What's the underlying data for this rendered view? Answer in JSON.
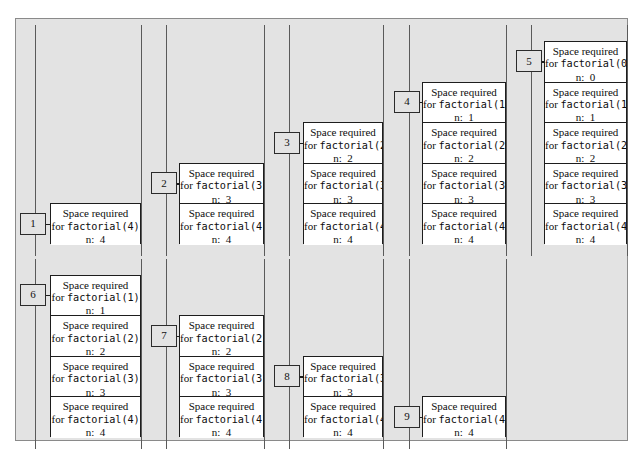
{
  "figure": {
    "background_color": "#e3e3e3",
    "frame_border_color": "#8a8a8a",
    "box_border_color": "#1d1d1d",
    "box_fill_color": "#ffffff",
    "wall_color": "#5a5a5a"
  },
  "frame_text": {
    "line1": "Space required",
    "line2_prefix": "for ",
    "line3_prefix": "n:"
  },
  "snapshots": [
    {
      "number": "1",
      "row": 1,
      "col": 1,
      "frames": [
        {
          "line1": "Space required",
          "call": "factorial(4)",
          "n": "4"
        }
      ]
    },
    {
      "number": "2",
      "row": 1,
      "col": 2,
      "frames": [
        {
          "line1": "Space required",
          "call": "factorial(3)",
          "n": "3"
        },
        {
          "line1": "Space required",
          "call": "factorial(4)",
          "n": "4"
        }
      ]
    },
    {
      "number": "3",
      "row": 1,
      "col": 3,
      "frames": [
        {
          "line1": "Space required",
          "call": "factorial(2)",
          "n": "2"
        },
        {
          "line1": "Space required",
          "call": "factorial(3)",
          "n": "3"
        },
        {
          "line1": "Space required",
          "call": "factorial(4)",
          "n": "4"
        }
      ]
    },
    {
      "number": "4",
      "row": 1,
      "col": 4,
      "frames": [
        {
          "line1": "Space required",
          "call": "factorial(1)",
          "n": "1"
        },
        {
          "line1": "Space required",
          "call": "factorial(2)",
          "n": "2"
        },
        {
          "line1": "Space required",
          "call": "factorial(3)",
          "n": "3"
        },
        {
          "line1": "Space required",
          "call": "factorial(4)",
          "n": "4"
        }
      ]
    },
    {
      "number": "5",
      "row": 1,
      "col": 5,
      "frames": [
        {
          "line1": "Space required",
          "call": "factorial(0)",
          "n": "0"
        },
        {
          "line1": "Space required",
          "call": "factorial(1)",
          "n": "1"
        },
        {
          "line1": "Space required",
          "call": "factorial(2)",
          "n": "2"
        },
        {
          "line1": "Space required",
          "call": "factorial(3)",
          "n": "3"
        },
        {
          "line1": "Space required",
          "call": "factorial(4)",
          "n": "4"
        }
      ]
    },
    {
      "number": "6",
      "row": 2,
      "col": 1,
      "frames": [
        {
          "line1": "Space required",
          "call": "factorial(1)",
          "n": "1"
        },
        {
          "line1": "Space required",
          "call": "factorial(2)",
          "n": "2"
        },
        {
          "line1": "Space required",
          "call": "factorial(3)",
          "n": "3"
        },
        {
          "line1": "Space required",
          "call": "factorial(4)",
          "n": "4"
        }
      ]
    },
    {
      "number": "7",
      "row": 2,
      "col": 2,
      "frames": [
        {
          "line1": "Space required",
          "call": "factorial(2)",
          "n": "2"
        },
        {
          "line1": "Space required",
          "call": "factorial(3)",
          "n": "3"
        },
        {
          "line1": "Space required",
          "call": "factorial(4)",
          "n": "4"
        }
      ]
    },
    {
      "number": "8",
      "row": 2,
      "col": 3,
      "frames": [
        {
          "line1": "Space required",
          "call": "factorial(3)",
          "n": "3"
        },
        {
          "line1": "Space required",
          "call": "factorial(4)",
          "n": "4"
        }
      ]
    },
    {
      "number": "9",
      "row": 2,
      "col": 4,
      "frames": [
        {
          "line1": "Space required",
          "call": "factorial(4)",
          "n": "4"
        }
      ]
    }
  ],
  "layout": {
    "columns": [
      {
        "wall_left": 19,
        "wall_right": 125,
        "box_left": 34,
        "box_right": 125,
        "badge_left": 4
      },
      {
        "wall_left": 150,
        "wall_right": 248,
        "box_left": 163,
        "box_right": 248,
        "badge_left": 135
      },
      {
        "wall_left": 273,
        "wall_right": 367,
        "box_left": 287,
        "box_right": 367,
        "badge_left": 258
      },
      {
        "wall_left": 393,
        "wall_right": 490,
        "box_left": 406,
        "box_right": 490,
        "badge_left": 378
      },
      {
        "wall_left": 515,
        "wall_right": 611,
        "box_left": 528,
        "box_right": 611,
        "badge_left": 500
      }
    ],
    "row1": {
      "wall_top": 6,
      "baseline": 225
    },
    "row2": {
      "wall_top": 240,
      "baseline": 418
    },
    "frame_height": 40.6,
    "badge_width": 26,
    "badge_height": 22
  }
}
